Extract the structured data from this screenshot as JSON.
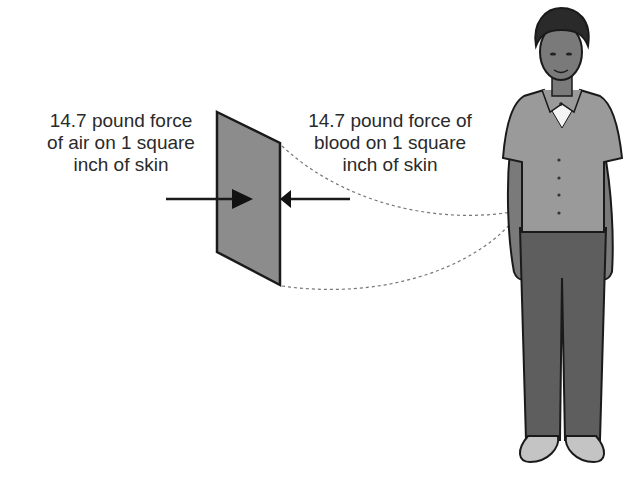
{
  "labels": {
    "air_force": {
      "line1": "14.7 pound force",
      "line2": "of air on 1 square",
      "line3": "inch of skin"
    },
    "blood_force": {
      "line1": "14.7 pound force of",
      "line2": "blood on 1 square",
      "line3": "inch of skin"
    }
  },
  "colors": {
    "skin_panel": "#8c8c8c",
    "shirt": "#9a9a9a",
    "pants": "#5e5e5e",
    "skin": "#7a7a7a",
    "shoes": "#c4c4c4",
    "outline": "#1a1a1a"
  }
}
